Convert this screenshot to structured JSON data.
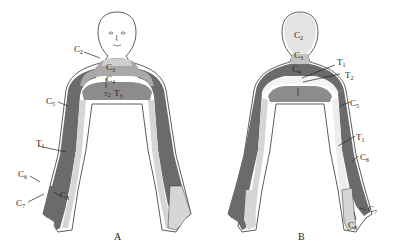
{
  "figure": {
    "colors": {
      "dark_band": "#6b6b6b",
      "medium_band": "#a9a9a9",
      "light_band": "#d6d6d6",
      "skin": "#ffffff",
      "outline": "#333333"
    },
    "panels": [
      {
        "id": "A",
        "caption": "A",
        "view": "anterior",
        "labels": [
          {
            "base": "C",
            "sub": "2"
          },
          {
            "base": "C",
            "sub": "3"
          },
          {
            "base": "C",
            "sub": "4"
          },
          {
            "base": "T",
            "sub": "2"
          },
          {
            "base": "T",
            "sub": "3"
          },
          {
            "base": "C",
            "sub": "5"
          },
          {
            "base": "T",
            "sub": "1"
          },
          {
            "base": "C",
            "sub": "6"
          },
          {
            "base": "C",
            "sub": "7"
          },
          {
            "base": "C",
            "sub": "8"
          }
        ]
      },
      {
        "id": "B",
        "caption": "B",
        "view": "posterior",
        "labels": [
          {
            "base": "C",
            "sub": "2"
          },
          {
            "base": "C",
            "sub": "3"
          },
          {
            "base": "C",
            "sub": "4"
          },
          {
            "base": "T",
            "sub": "1"
          },
          {
            "base": "T",
            "sub": "2"
          },
          {
            "base": "C",
            "sub": "5"
          },
          {
            "base": "T",
            "sub": "1"
          },
          {
            "base": "C",
            "sub": "6"
          },
          {
            "base": "C",
            "sub": "7"
          },
          {
            "base": "C",
            "sub": "8"
          }
        ]
      }
    ]
  }
}
